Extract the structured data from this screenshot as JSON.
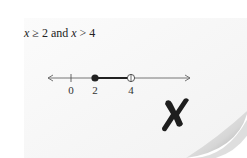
{
  "statement": {
    "var1": "x",
    "op1": "≥",
    "val1": "2",
    "conj": "and",
    "var2": "x",
    "op2": ">",
    "val2": "4"
  },
  "number_line": {
    "tick_labels": [
      "0",
      "2",
      "4"
    ],
    "closed_point": "2",
    "open_point": "4"
  },
  "mark": {
    "symbol": "✗",
    "meaning": "incorrect"
  }
}
